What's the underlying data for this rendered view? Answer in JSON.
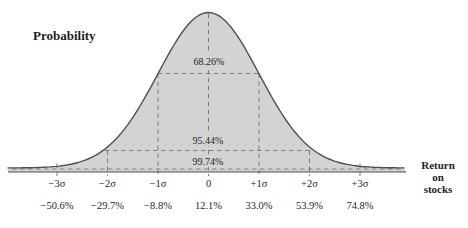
{
  "title": "Probability",
  "right_axis_label": {
    "lines": [
      "Return",
      "on",
      "stocks"
    ]
  },
  "chart_data": {
    "type": "area",
    "subtype": "normal-distribution-bell-curve",
    "title": "Probability",
    "ylabel": "Probability",
    "xlabel": "Return on stocks",
    "x_axis_sigma_ticks": [
      "−3σ",
      "−2σ",
      "−1σ",
      "0",
      "+1σ",
      "+2σ",
      "+3σ"
    ],
    "x_axis_return_ticks": [
      "−50.6%",
      "−29.7%",
      "−8.8%",
      "12.1%",
      "33.0%",
      "53.9%",
      "74.8%"
    ],
    "bands": [
      {
        "range_sigma": "−1σ to +1σ",
        "probability": "68.26%"
      },
      {
        "range_sigma": "−2σ to +2σ",
        "probability": "95.44%"
      },
      {
        "range_sigma": "−3σ to +3σ",
        "probability": "99.74%"
      }
    ],
    "grid": "dashed sigma guides",
    "legend": "none",
    "curve_filled": true
  },
  "colors": {
    "background": "#ffffff",
    "curve_fill": "#d3d3d3",
    "curve_stroke": "#4f4f4f",
    "dashed_line": "#7d7d7d",
    "axis_line": "#4f4f4f",
    "text": "#1f1f1f"
  }
}
